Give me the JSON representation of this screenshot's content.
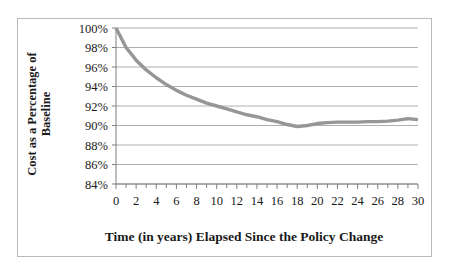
{
  "chart_data": {
    "type": "line",
    "title": "",
    "xlabel": "Time (in years) Elapsed Since the Policy Change",
    "ylabel": "Cost as a Percentage of Baseline",
    "ylabel_line1": "Cost as a Percentage of",
    "ylabel_line2": "Baseline",
    "xlim": [
      0,
      30
    ],
    "ylim": [
      84,
      100
    ],
    "grid": true,
    "legend": false,
    "series_color": "#969696",
    "gridline_color": "#a6a6a6",
    "axis_color": "#808080",
    "border_color": "#b9b9b9",
    "ytick_labels": [
      "100%",
      "98%",
      "96%",
      "94%",
      "92%",
      "90%",
      "88%",
      "86%",
      "84%"
    ],
    "ytick_values": [
      100,
      98,
      96,
      94,
      92,
      90,
      88,
      86,
      84
    ],
    "xtick_labels": [
      "0",
      "2",
      "4",
      "6",
      "8",
      "10",
      "12",
      "14",
      "16",
      "18",
      "20",
      "22",
      "24",
      "26",
      "28",
      "30"
    ],
    "xtick_values": [
      0,
      2,
      4,
      6,
      8,
      10,
      12,
      14,
      16,
      18,
      20,
      22,
      24,
      26,
      28,
      30
    ],
    "xminor_values": [
      1,
      3,
      5,
      7,
      9,
      11,
      13,
      15,
      17,
      19,
      21,
      23,
      25,
      27,
      29
    ],
    "x": [
      0,
      1,
      2,
      3,
      4,
      5,
      6,
      7,
      8,
      9,
      10,
      11,
      12,
      13,
      14,
      15,
      16,
      17,
      18,
      19,
      20,
      21,
      22,
      23,
      24,
      25,
      26,
      27,
      28,
      29,
      30
    ],
    "values": [
      100.0,
      98.0,
      96.7,
      95.7,
      94.9,
      94.2,
      93.6,
      93.1,
      92.7,
      92.3,
      92.0,
      91.7,
      91.4,
      91.1,
      90.9,
      90.6,
      90.4,
      90.1,
      89.9,
      90.0,
      90.2,
      90.3,
      90.35,
      90.35,
      90.35,
      90.4,
      90.4,
      90.45,
      90.55,
      90.7,
      90.6
    ],
    "series": [
      {
        "name": "Cost as a Percentage of Baseline",
        "values": [
          100.0,
          98.0,
          96.7,
          95.7,
          94.9,
          94.2,
          93.6,
          93.1,
          92.7,
          92.3,
          92.0,
          91.7,
          91.4,
          91.1,
          90.9,
          90.6,
          90.4,
          90.1,
          89.9,
          90.0,
          90.2,
          90.3,
          90.35,
          90.35,
          90.35,
          90.4,
          90.4,
          90.45,
          90.55,
          90.7,
          90.6
        ]
      }
    ]
  }
}
